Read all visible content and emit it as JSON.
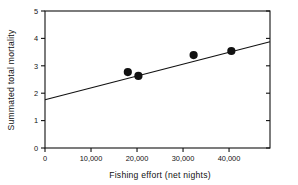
{
  "chart_data": {
    "type": "scatter",
    "title": "",
    "xlabel": "Fishing effort (net nights)",
    "ylabel": "Summated total mortality",
    "xlim": [
      0,
      48900
    ],
    "ylim": [
      0,
      5
    ],
    "grid": false,
    "legend": "none",
    "xticks": [
      0,
      10000,
      20000,
      30000,
      40000
    ],
    "xtick_labels": [
      "0",
      "10,000",
      "20,000",
      "30,000",
      "40,000"
    ],
    "yticks": [
      0,
      1,
      2,
      3,
      4,
      5
    ],
    "ytick_labels": [
      "0",
      "1",
      "2",
      "3",
      "4",
      "5"
    ],
    "points": [
      {
        "x": 18000,
        "y": 2.77
      },
      {
        "x": 20300,
        "y": 2.63
      },
      {
        "x": 32300,
        "y": 3.39
      },
      {
        "x": 40500,
        "y": 3.54
      }
    ],
    "series": [
      {
        "name": "Summated total mortality",
        "x": [
          18000,
          20300,
          32300,
          40500
        ],
        "values": [
          2.77,
          2.63,
          3.39,
          3.54
        ],
        "marker": "filled-circle",
        "color": "#111111"
      },
      {
        "name": "Regression line",
        "type": "line",
        "x": [
          0,
          48900
        ],
        "values": [
          1.76,
          3.88
        ],
        "color": "#111111"
      }
    ],
    "annotations": []
  },
  "axes": {
    "x_title": "Fishing effort (net nights)",
    "y_title": "Summated total mortality"
  },
  "colors": {
    "ink": "#111111",
    "background": "#ffffff"
  }
}
